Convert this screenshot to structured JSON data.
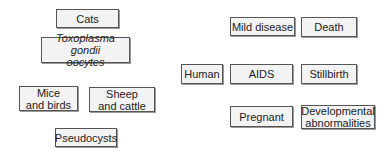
{
  "nodes": {
    "cats": "Cats",
    "toxoplasma": "Toxoplasma gondii\noocytes",
    "mice_birds": "Mice\nand birds",
    "sheep_cattle": "Sheep\nand cattle",
    "pseudocysts": "Pseudocysts",
    "human": "Human",
    "aids": "AIDS",
    "stillbirth": "Stillbirth",
    "mild_disease": "Mild disease",
    "death": "Death",
    "pregnant": "Pregnant",
    "developmental": "Developmental\nabnormalities"
  }
}
